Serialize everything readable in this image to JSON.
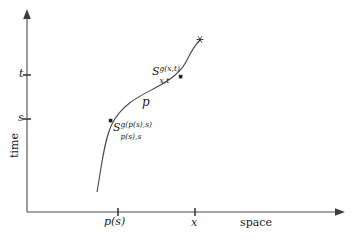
{
  "figure": {
    "kind": "space-time-diagram",
    "background_color": "#ffffff",
    "line_color": "#3d3d3d",
    "text_color": "#1a1a1a"
  },
  "axes": {
    "x": {
      "title": "space",
      "ticks": [
        {
          "label": "p(s)",
          "pixel_x": 118
        },
        {
          "label": "x",
          "pixel_x": 195
        }
      ],
      "arrow": "right",
      "baseline_pixel_y": 212
    },
    "y": {
      "title": "time",
      "ticks": [
        {
          "label": "t",
          "pixel_y": 75
        },
        {
          "label": "s",
          "pixel_y": 119
        }
      ],
      "arrow": "up",
      "baseline_pixel_x": 27
    }
  },
  "curve": {
    "name_label": "p",
    "path": "M 97,192 C 101,170 104,140 112,124 C 122,104 140,96 155,88 C 170,80 182,72 188,58 C 193,48 197,43 200,40",
    "endpoint_marker": "asterisk-marker",
    "endpoint": {
      "pixel_x": 200,
      "pixel_y": 40
    },
    "points": [
      {
        "name": "lower-point",
        "pixel_x": 111,
        "pixel_y": 121
      },
      {
        "name": "upper-point",
        "pixel_x": 181,
        "pixel_y": 77
      }
    ]
  },
  "annotations": {
    "lower": {
      "base": "S",
      "superscript": "g(p(s),s)",
      "subscript": "p(s),s"
    },
    "upper": {
      "base": "S",
      "superscript": "g(x,t)",
      "subscript": "x,t"
    }
  }
}
